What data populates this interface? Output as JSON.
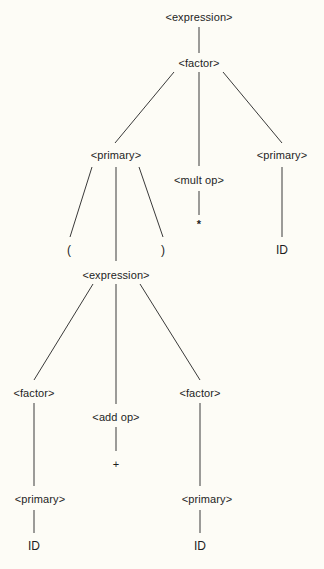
{
  "diagram": {
    "type": "parse-tree",
    "background": "#fdfcf6",
    "line_color": "#3a3a3a",
    "nodes": {
      "root_expression": {
        "label": "<expression>",
        "x": 199,
        "y": 17
      },
      "factor_top": {
        "label": "<factor>",
        "x": 199,
        "y": 63
      },
      "primary_left": {
        "label": "<primary>",
        "x": 116,
        "y": 155
      },
      "mult_op": {
        "label": "<mult op>",
        "x": 199,
        "y": 180
      },
      "primary_right": {
        "label": "<primary>",
        "x": 282,
        "y": 155
      },
      "lparen": {
        "label": "(",
        "x": 69,
        "y": 250
      },
      "rparen": {
        "label": ")",
        "x": 163,
        "y": 250
      },
      "star": {
        "label": "*",
        "x": 199,
        "y": 224
      },
      "id_right": {
        "label": "ID",
        "x": 282,
        "y": 250
      },
      "inner_expression": {
        "label": "<expression>",
        "x": 116,
        "y": 275
      },
      "factor_left": {
        "label": "<factor>",
        "x": 34,
        "y": 393
      },
      "add_op": {
        "label": "<add op>",
        "x": 116,
        "y": 417
      },
      "factor_right": {
        "label": "<factor>",
        "x": 200,
        "y": 393
      },
      "plus": {
        "label": "+",
        "x": 116,
        "y": 464
      },
      "primary_bottom_left": {
        "label": "<primary>",
        "x": 40,
        "y": 499
      },
      "primary_bottom_right": {
        "label": "<primary>",
        "x": 207,
        "y": 499
      },
      "id_bottom_left": {
        "label": "ID",
        "x": 34,
        "y": 546
      },
      "id_bottom_right": {
        "label": "ID",
        "x": 200,
        "y": 546
      }
    },
    "edges": [
      {
        "from": "root_expression",
        "to": "factor_top"
      },
      {
        "from": "factor_top",
        "to": "primary_left"
      },
      {
        "from": "factor_top",
        "to": "mult_op"
      },
      {
        "from": "factor_top",
        "to": "primary_right"
      },
      {
        "from": "primary_left",
        "to": "lparen"
      },
      {
        "from": "primary_left",
        "to": "inner_expression"
      },
      {
        "from": "primary_left",
        "to": "rparen"
      },
      {
        "from": "mult_op",
        "to": "star"
      },
      {
        "from": "primary_right",
        "to": "id_right"
      },
      {
        "from": "inner_expression",
        "to": "factor_left"
      },
      {
        "from": "inner_expression",
        "to": "add_op"
      },
      {
        "from": "inner_expression",
        "to": "factor_right"
      },
      {
        "from": "add_op",
        "to": "plus"
      },
      {
        "from": "factor_left",
        "to": "primary_bottom_left"
      },
      {
        "from": "factor_right",
        "to": "primary_bottom_right"
      },
      {
        "from": "primary_bottom_left",
        "to": "id_bottom_left"
      },
      {
        "from": "primary_bottom_right",
        "to": "id_bottom_right"
      }
    ]
  }
}
